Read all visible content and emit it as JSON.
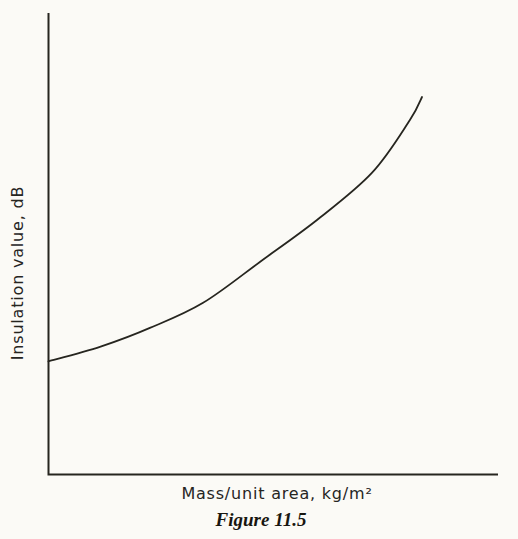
{
  "page": {
    "background_color": "#fbfaf6",
    "ink_color": "#26251f"
  },
  "chart_data": {
    "type": "line",
    "title": "",
    "xlabel": "Mass/unit area, kg/m²",
    "ylabel": "Insulation value, dB",
    "caption": "Figure 11.5",
    "grid": false,
    "legend": false,
    "x_axis": {
      "tick_labels": []
    },
    "y_axis": {
      "tick_labels": []
    },
    "series": [
      {
        "name": "insulation-vs-mass-curve",
        "shape": "monotonic increasing, exponential-like, starts at y-axis and ends before right edge",
        "points_normalized": [
          [
            0.0,
            0.245
          ],
          [
            0.116,
            0.277
          ],
          [
            0.227,
            0.318
          ],
          [
            0.344,
            0.372
          ],
          [
            0.471,
            0.461
          ],
          [
            0.598,
            0.552
          ],
          [
            0.72,
            0.654
          ],
          [
            0.804,
            0.768
          ],
          [
            0.831,
            0.818
          ]
        ]
      }
    ]
  }
}
